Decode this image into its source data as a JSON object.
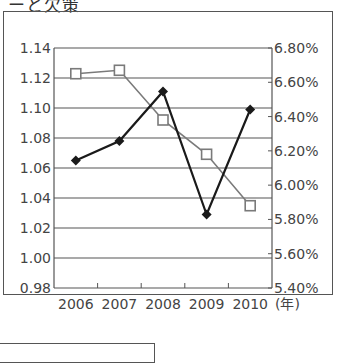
{
  "header": {
    "title_fragment": "ーと欠策"
  },
  "chart_data": {
    "type": "line",
    "title": "",
    "xlabel": "(年)",
    "ylabel_left": "",
    "ylabel_right": "",
    "categories": [
      "2006",
      "2007",
      "2008",
      "2009",
      "2010"
    ],
    "x_unit_label": "(年)",
    "left_axis": {
      "ticks": [
        "1.14",
        "1.12",
        "1.10",
        "1.08",
        "1.06",
        "1.04",
        "1.02",
        "1.00",
        "0.98"
      ],
      "range": [
        0.98,
        1.14
      ]
    },
    "right_axis": {
      "ticks": [
        "6.80%",
        "6.60%",
        "6.40%",
        "6.20%",
        "6.00%",
        "5.80%",
        "5.60%",
        "5.40%"
      ],
      "range": [
        5.4,
        6.8
      ],
      "unit": "%"
    },
    "grid": true,
    "legend": "none visible",
    "series": [
      {
        "name": "series-left-black-diamond",
        "axis": "left",
        "marker": "filled-diamond",
        "color": "#1a1a1a",
        "values": [
          1.065,
          1.078,
          1.111,
          1.029,
          1.099
        ]
      },
      {
        "name": "series-right-gray-square",
        "axis": "right",
        "marker": "hollow-square",
        "color": "#7a7a7a",
        "values": [
          6.65,
          6.67,
          6.38,
          6.18,
          5.88
        ]
      }
    ]
  },
  "colors": {
    "grid": "#555555",
    "series_black": "#1a1a1a",
    "series_gray": "#7a7a7a",
    "text": "#444444"
  }
}
